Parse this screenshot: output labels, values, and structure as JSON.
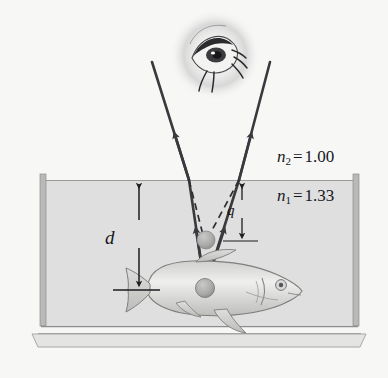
{
  "figure": {
    "background_color": "#f7f7f6",
    "water_color": "#dfdfdf",
    "glass_color": "#b9b9b9",
    "ray_color": "#3a3a3e",
    "labels": {
      "n2": {
        "symbol": "n",
        "subscript": "2",
        "equals": "=",
        "value": "1.00"
      },
      "n1": {
        "symbol": "n",
        "subscript": "1",
        "equals": "=",
        "value": "1.33"
      },
      "depth": "d",
      "apparent_depth": "q"
    },
    "objects": {
      "eye": "observer-eye",
      "fish": "fish",
      "source_point": "light-source-point",
      "virtual_image_point": "virtual-image-point"
    },
    "rays": {
      "left_refracted": "left-refracted-ray",
      "right_refracted": "right-refracted-ray",
      "left_incident": "left-incident-ray",
      "right_incident": "right-incident-ray",
      "left_virtual": "left-virtual-dashed-ray",
      "right_virtual": "right-virtual-dashed-ray"
    }
  }
}
